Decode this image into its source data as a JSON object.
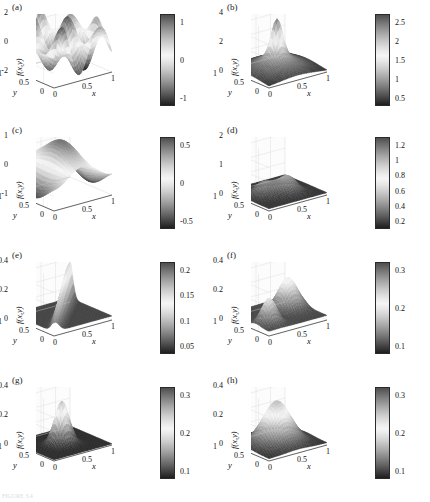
{
  "figure": {
    "width": 430,
    "height": 502,
    "background": "#ffffff",
    "caption_faint": "FIGURE 3.4",
    "ylabel": "f(x,y)",
    "xname": "x",
    "yname": "y",
    "base_xticks": [
      "0",
      "0.5",
      "1"
    ],
    "base_yticks": [
      "1",
      "0.5",
      "0"
    ],
    "colorbar_colors": {
      "dark": "#1c1c1c",
      "mid": "#ebebeb",
      "light_band": "#f2f2f2"
    }
  },
  "chart_data": [
    {
      "type": "surface",
      "panel": "a",
      "label": "(a)",
      "title": "",
      "xlabel": "x",
      "ylabel": "y",
      "zlabel": "f(x,y)",
      "xlim": [
        0,
        1
      ],
      "ylim": [
        0,
        1
      ],
      "zlim": [
        -2,
        2
      ],
      "zticks": [
        "2",
        "0",
        "-2"
      ],
      "ztick_values": [
        2,
        0,
        -2
      ],
      "colorbar_ticks": [
        "1",
        "0",
        "-1"
      ],
      "colorbar_tick_values": [
        1,
        0,
        -1
      ],
      "colorbar_range": [
        -1.8,
        1.8
      ],
      "description": "oscillatory multi-peak sinusoidal surface"
    },
    {
      "type": "surface",
      "panel": "b",
      "label": "(b)",
      "title": "",
      "xlabel": "x",
      "ylabel": "y",
      "zlabel": "f(x,y)",
      "xlim": [
        0,
        1
      ],
      "ylim": [
        0,
        1
      ],
      "zlim": [
        0,
        4
      ],
      "zticks": [
        "4",
        "2",
        "0"
      ],
      "ztick_values": [
        4,
        2,
        0
      ],
      "colorbar_ticks": [
        "2.5",
        "2",
        "1.5",
        "1",
        "0.5"
      ],
      "colorbar_tick_values": [
        2.5,
        2,
        1.5,
        1,
        0.5
      ],
      "colorbar_range": [
        0.2,
        2.7
      ],
      "description": "central narrow peak with broad raised rim"
    },
    {
      "type": "surface",
      "panel": "c",
      "label": "(c)",
      "title": "",
      "xlabel": "x",
      "ylabel": "y",
      "zlabel": "f(x,y)",
      "xlim": [
        0,
        1
      ],
      "ylim": [
        0,
        1
      ],
      "zlim": [
        -1,
        1
      ],
      "zticks": [
        "1",
        "0",
        "-1"
      ],
      "ztick_values": [
        1,
        0,
        -1
      ],
      "colorbar_ticks": [
        "0.5",
        "0",
        "-0.5"
      ],
      "colorbar_tick_values": [
        0.5,
        0,
        -0.5
      ],
      "colorbar_range": [
        -0.9,
        0.9
      ],
      "description": "antisymmetric dipole: one positive hump and one negative well"
    },
    {
      "type": "surface",
      "panel": "d",
      "label": "(d)",
      "title": "",
      "xlabel": "x",
      "ylabel": "y",
      "zlabel": "f(x,y)",
      "xlim": [
        0,
        1
      ],
      "ylim": [
        0,
        1
      ],
      "zlim": [
        0,
        2
      ],
      "zticks": [
        "2",
        "1",
        "0"
      ],
      "ztick_values": [
        2,
        1,
        0
      ],
      "colorbar_ticks": [
        "1.2",
        "1",
        "0.8",
        "0.6",
        "0.4",
        "0.2"
      ],
      "colorbar_tick_values": [
        1.2,
        1,
        0.8,
        0.6,
        0.4,
        0.2
      ],
      "colorbar_range": [
        0.05,
        1.3
      ],
      "description": "low rough ridge with two adjacent mounds"
    },
    {
      "type": "surface",
      "panel": "e",
      "label": "(e)",
      "title": "",
      "xlabel": "x",
      "ylabel": "y",
      "zlabel": "f(x,y)",
      "xlim": [
        0,
        1
      ],
      "ylim": [
        0,
        1
      ],
      "zlim": [
        0,
        0.4
      ],
      "zticks": [
        "0.4",
        "0.2",
        "0"
      ],
      "ztick_values": [
        0.4,
        0.2,
        0
      ],
      "colorbar_ticks": [
        "0.2",
        "0.15",
        "0.1",
        "0.05"
      ],
      "colorbar_tick_values": [
        0.2,
        0.15,
        0.1,
        0.05
      ],
      "colorbar_range": [
        0.0,
        0.23
      ],
      "description": "saddle-like diagonal fold rising steeply along a ridge"
    },
    {
      "type": "surface",
      "panel": "f",
      "label": "(f)",
      "title": "",
      "xlabel": "x",
      "ylabel": "y",
      "zlabel": "f(x,y)",
      "xlim": [
        0,
        1
      ],
      "ylim": [
        0,
        1
      ],
      "zlim": [
        0,
        0.4
      ],
      "zticks": [
        "0.4",
        "0.2",
        "0"
      ],
      "ztick_values": [
        0.4,
        0.2,
        0
      ],
      "colorbar_ticks": [
        "0.3",
        "0.2",
        "0.1"
      ],
      "colorbar_tick_values": [
        0.3,
        0.2,
        0.1
      ],
      "colorbar_range": [
        0.0,
        0.34
      ],
      "description": "two separated peaks with a curved valley between them"
    },
    {
      "type": "surface",
      "panel": "g",
      "label": "(g)",
      "title": "",
      "xlabel": "x",
      "ylabel": "y",
      "zlabel": "f(x,y)",
      "xlim": [
        0,
        1
      ],
      "ylim": [
        0,
        1
      ],
      "zlim": [
        0,
        0.4
      ],
      "zticks": [
        "0.4",
        "0.2",
        "0"
      ],
      "ztick_values": [
        0.4,
        0.2,
        0
      ],
      "colorbar_ticks": [
        "0.3",
        "0.2",
        "0.1"
      ],
      "colorbar_tick_values": [
        0.3,
        0.2,
        0.1
      ],
      "colorbar_range": [
        0.0,
        0.34
      ],
      "description": "single symmetric Gaussian bump on a flat dark plane"
    },
    {
      "type": "surface",
      "panel": "h",
      "label": "(h)",
      "title": "",
      "xlabel": "x",
      "ylabel": "y",
      "zlabel": "f(x,y)",
      "xlim": [
        0,
        1
      ],
      "ylim": [
        0,
        1
      ],
      "zlim": [
        0,
        0.4
      ],
      "zticks": [
        "0.4",
        "0.2",
        "0"
      ],
      "ztick_values": [
        0.4,
        0.2,
        0
      ],
      "colorbar_ticks": [
        "0.3",
        "0.2",
        "0.1"
      ],
      "colorbar_tick_values": [
        0.3,
        0.2,
        0.1
      ],
      "colorbar_range": [
        0.0,
        0.34
      ],
      "description": "broad rounded dome filling the whole domain"
    }
  ]
}
